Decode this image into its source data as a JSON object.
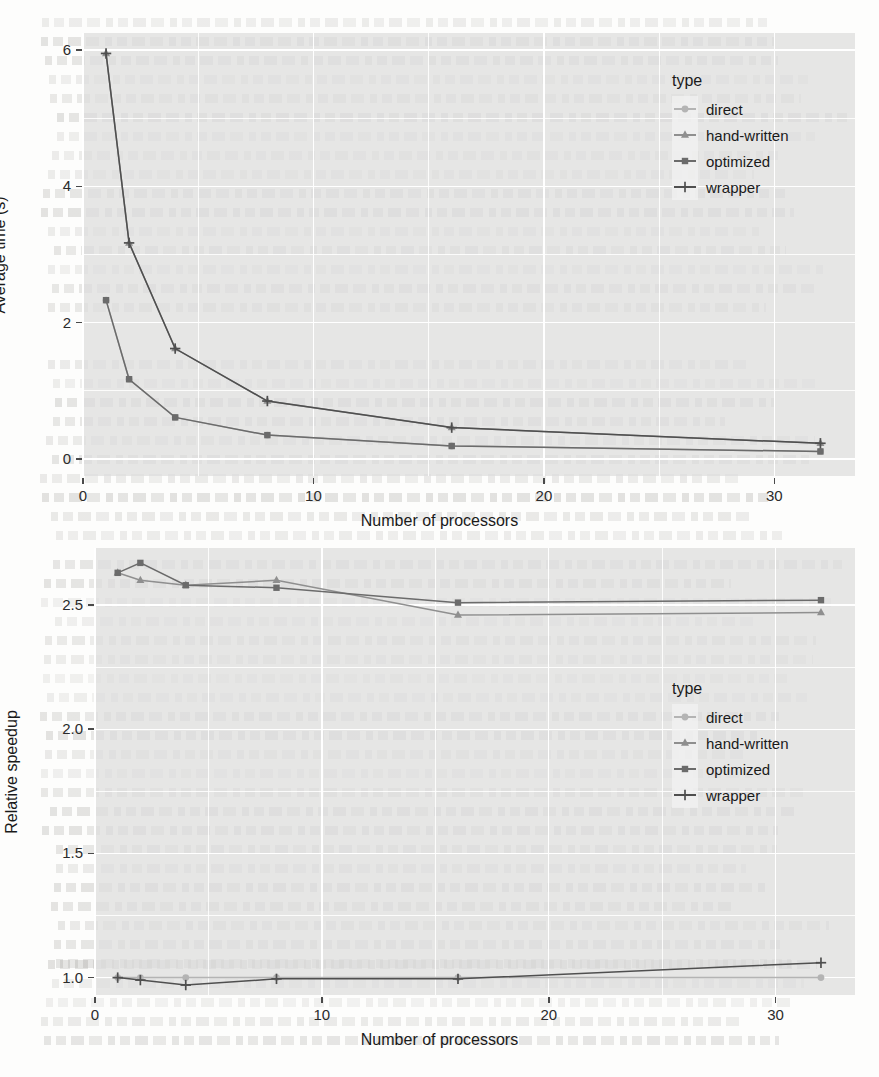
{
  "page": {
    "background_note": "faint scanned journal page behind the two figures"
  },
  "legend": {
    "title": "type",
    "entries": [
      {
        "label": "direct",
        "marker": "circle",
        "color": "#b4b4b4"
      },
      {
        "label": "hand-written",
        "marker": "triangle",
        "color": "#8f8f8f"
      },
      {
        "label": "optimized",
        "marker": "square",
        "color": "#6b6b6b"
      },
      {
        "label": "wrapper",
        "marker": "plus",
        "color": "#4f4f4f"
      }
    ]
  },
  "chart_data": [
    {
      "type": "line",
      "id": "average-time",
      "title": "",
      "xlabel": "Number of processors",
      "ylabel": "Average time (s)",
      "x": [
        1,
        2,
        4,
        8,
        16,
        32
      ],
      "xlim": [
        0.0,
        33.5
      ],
      "ylim": [
        -0.25,
        6.25
      ],
      "xticks": [
        0,
        10,
        20,
        30
      ],
      "xticklabels": [
        "0",
        "10",
        "20",
        "30"
      ],
      "yticks": [
        0,
        2,
        4,
        6
      ],
      "yticklabels": [
        "0",
        "2",
        "4",
        "6"
      ],
      "grid": true,
      "legend_position": "right-inside-top",
      "series": [
        {
          "name": "direct",
          "marker": "circle",
          "color": "#b4b4b4",
          "values": [
            2.33,
            1.17,
            0.61,
            0.35,
            0.19,
            0.11
          ]
        },
        {
          "name": "hand-written",
          "marker": "triangle",
          "color": "#8f8f8f",
          "values": [
            5.95,
            3.17,
            1.62,
            0.85,
            0.46,
            0.23
          ]
        },
        {
          "name": "optimized",
          "marker": "square",
          "color": "#6b6b6b",
          "values": [
            2.33,
            1.17,
            0.61,
            0.35,
            0.19,
            0.11
          ]
        },
        {
          "name": "wrapper",
          "marker": "plus",
          "color": "#4f4f4f",
          "values": [
            5.95,
            3.17,
            1.62,
            0.85,
            0.46,
            0.23
          ]
        }
      ]
    },
    {
      "type": "line",
      "id": "relative-speedup",
      "title": "",
      "xlabel": "Number of processors",
      "ylabel": "Relative speedup",
      "x": [
        1,
        2,
        4,
        8,
        16,
        32
      ],
      "xlim": [
        0.0,
        33.5
      ],
      "ylim": [
        0.93,
        2.73
      ],
      "xticks": [
        0,
        10,
        20,
        30
      ],
      "xticklabels": [
        "0",
        "10",
        "20",
        "30"
      ],
      "yticks": [
        1.0,
        1.5,
        2.0,
        2.5
      ],
      "yticklabels": [
        "1.0",
        "1.5",
        "2.0",
        "2.5"
      ],
      "grid": true,
      "legend_position": "right-inside-middle",
      "series": [
        {
          "name": "direct",
          "marker": "circle",
          "color": "#b4b4b4",
          "values": [
            1.0,
            1.0,
            1.0,
            1.0,
            1.0,
            1.0
          ]
        },
        {
          "name": "hand-written",
          "marker": "triangle",
          "color": "#8f8f8f",
          "values": [
            2.63,
            2.6,
            2.58,
            2.6,
            2.46,
            2.47
          ]
        },
        {
          "name": "optimized",
          "marker": "square",
          "color": "#6b6b6b",
          "values": [
            2.63,
            2.67,
            2.58,
            2.57,
            2.51,
            2.52
          ]
        },
        {
          "name": "wrapper",
          "marker": "plus",
          "color": "#4f4f4f",
          "values": [
            1.0,
            0.99,
            0.97,
            0.995,
            0.995,
            1.06
          ]
        }
      ]
    }
  ]
}
